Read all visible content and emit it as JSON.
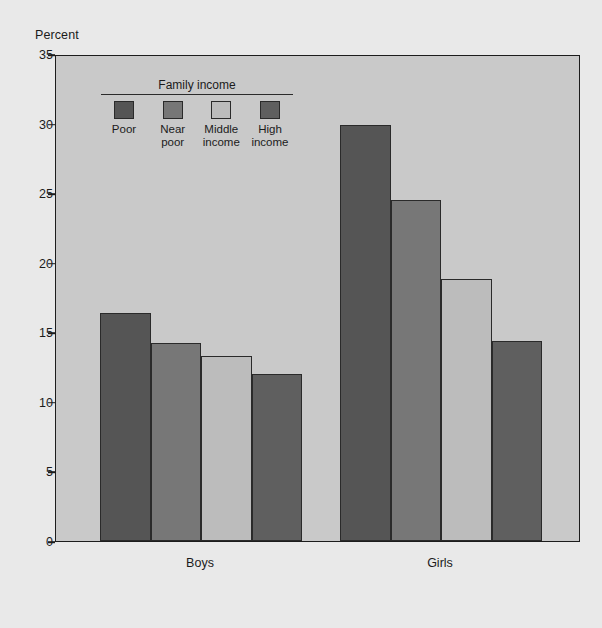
{
  "chart_data": {
    "type": "bar",
    "title": "",
    "ylabel": "Percent",
    "xlabel": "",
    "ylim": [
      0,
      35
    ],
    "yticks": [
      0,
      5,
      10,
      15,
      20,
      25,
      30,
      35
    ],
    "grid": false,
    "legend_position": "inside-top-left",
    "legend_title": "Family income",
    "categories": [
      "Boys",
      "Girls"
    ],
    "series": [
      {
        "name": "Poor",
        "values": [
          16.4,
          29.9
        ],
        "color": "#555555"
      },
      {
        "name": "Near\npoor",
        "values": [
          14.2,
          24.5
        ],
        "color": "#777777"
      },
      {
        "name": "Middle\nincome",
        "values": [
          13.3,
          18.8
        ],
        "color": "#bcbcbc"
      },
      {
        "name": "High\nincome",
        "values": [
          12.0,
          14.4
        ],
        "color": "#5f5f5f"
      }
    ]
  },
  "figure": {
    "background_color": "#e9e9e9",
    "plot_background_color": "#c9c9c9",
    "axis_color": "#1c1c1c"
  }
}
